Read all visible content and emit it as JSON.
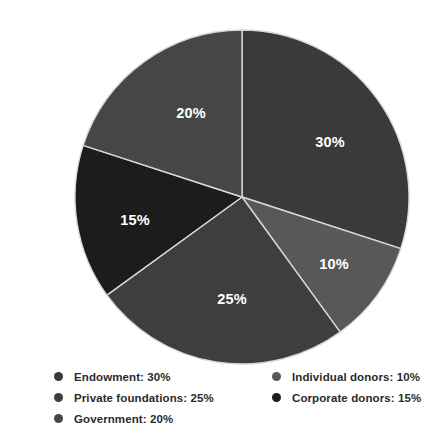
{
  "chart_data": {
    "type": "pie",
    "title": "",
    "subtitle": "",
    "xlabel": "",
    "ylabel": "",
    "grid": false,
    "legend_position": "bottom",
    "start_angle_deg": 0,
    "direction": "clockwise",
    "categories": [
      "Endowment",
      "Individual donors",
      "Private foundations",
      "Corporate donors",
      "Government"
    ],
    "values": [
      30,
      10,
      25,
      15,
      20
    ],
    "value_unit": "%",
    "slices": [
      {
        "name": "Endowment",
        "value": 30,
        "label": "30%",
        "color": "#3a3a3a",
        "start_deg": 0,
        "end_deg": 108,
        "label_x": 290,
        "label_y": 127
      },
      {
        "name": "Individual donors",
        "value": 10,
        "label": "10%",
        "color": "#585858",
        "start_deg": 108,
        "end_deg": 144,
        "label_x": 294,
        "label_y": 249
      },
      {
        "name": "Private foundations",
        "value": 25,
        "label": "25%",
        "color": "#3e3e3e",
        "start_deg": 144,
        "end_deg": 234,
        "label_x": 192,
        "label_y": 284
      },
      {
        "name": "Corporate donors",
        "value": 15,
        "label": "15%",
        "color": "#1c1c1c",
        "start_deg": 234,
        "end_deg": 288,
        "label_x": 95,
        "label_y": 205
      },
      {
        "name": "Government",
        "value": 20,
        "label": "20%",
        "color": "#464646",
        "start_deg": 288,
        "end_deg": 360,
        "label_x": 151,
        "label_y": 98
      }
    ],
    "geometry": {
      "center_x": 202,
      "center_y": 181,
      "radius": 167
    }
  },
  "legend": {
    "columns": [
      {
        "items": [
          {
            "label": "Endowment: 30%",
            "color": "#3a3a3a",
            "name": "Endowment",
            "value": 30
          },
          {
            "label": "Private foundations: 25%",
            "color": "#3e3e3e",
            "name": "Private foundations",
            "value": 25
          },
          {
            "label": "Government: 20%",
            "color": "#464646",
            "name": "Government",
            "value": 20
          }
        ]
      },
      {
        "items": [
          {
            "label": "Individual donors: 10%",
            "color": "#585858",
            "name": "Individual donors",
            "value": 10
          },
          {
            "label": "Corporate donors: 15%",
            "color": "#1c1c1c",
            "name": "Corporate donors",
            "value": 15
          }
        ]
      }
    ]
  },
  "colors": {
    "background": "#ffffff",
    "slice_outline": "#d8d8d8",
    "label_text": "#ffffff",
    "legend_text": "#2b2b2b"
  }
}
